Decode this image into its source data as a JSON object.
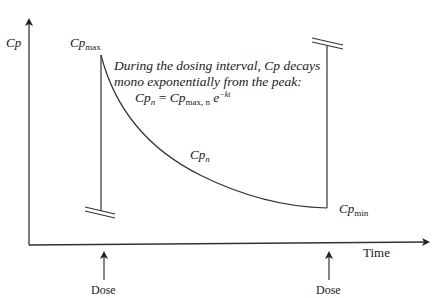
{
  "diagram": {
    "type": "pharmacokinetic concentration-time curve (single dosing interval)",
    "y_axis": {
      "label": "Cp"
    },
    "x_axis": {
      "label": "Time"
    },
    "labels": {
      "cp_max_base": "Cp",
      "cp_max_sub": "max",
      "cp_min_base": "Cp",
      "cp_min_sub": "min",
      "cp_n_base": "Cp",
      "cp_n_sub": "n"
    },
    "annotation": {
      "line1": "During the dosing interval, Cp decays",
      "line2": "mono exponentially from the peak:",
      "equation": {
        "lhs_base": "Cp",
        "lhs_sub": "n",
        "equals": " = ",
        "rhs_base": "Cp",
        "rhs_sub": "max, n",
        "exp_base": " e",
        "exp_sup": "−kt"
      }
    },
    "dose_markers": [
      {
        "label": "Dose"
      },
      {
        "label": "Dose"
      }
    ],
    "colors": {
      "line": "#333333",
      "text": "#1a1a1a",
      "background": "#ffffff"
    }
  }
}
